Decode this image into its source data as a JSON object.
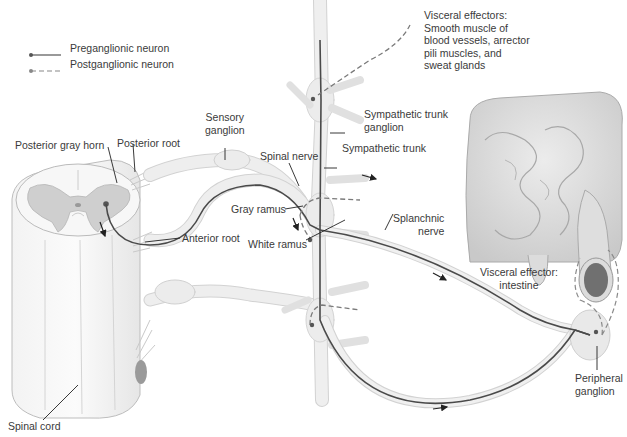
{
  "legend": {
    "preganglionic": "Preganglionic neuron",
    "postganglionic": "Postganglionic neuron"
  },
  "labels": {
    "visceral_effectors": "Visceral effectors:\nSmooth muscle of\nblood vessels, arrector\npili muscles, and\nsweat glands",
    "sympathetic_trunk_ganglion": "Sympathetic trunk\nganglion",
    "sympathetic_trunk": "Sympathetic trunk",
    "sensory_ganglion": "Sensory\nganglion",
    "posterior_gray_horn": "Posterior gray horn",
    "posterior_root": "Posterior root",
    "spinal_nerve": "Spinal nerve",
    "gray_ramus": "Gray ramus",
    "white_ramus": "White ramus",
    "anterior_root": "Anterior root",
    "splanchnic_nerve": "Splanchnic\nnerve",
    "visceral_effector_intestine": "Visceral effector:\nintestine",
    "peripheral_ganglion": "Peripheral\nganglion",
    "spinal_cord": "Spinal cord"
  },
  "colors": {
    "nerve_fill": "#ececec",
    "nerve_edge": "#c8c8c8",
    "neuron_line": "#4a4a4a",
    "gray_matter": "#c9c9c9",
    "tissue": "#e2e2e2",
    "lumen": "#707070"
  }
}
